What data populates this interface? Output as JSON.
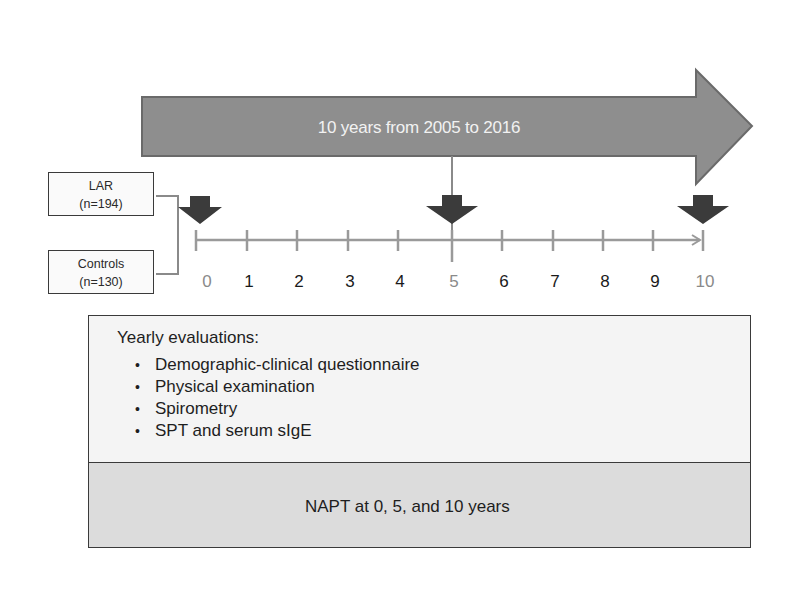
{
  "diagram": {
    "banner": {
      "text": "10 years from 2005 to 2016",
      "fill_color": "#8e8e8e",
      "text_color": "#f2f2f2"
    },
    "groups": [
      {
        "name": "LAR",
        "n_label": "(n=194)"
      },
      {
        "name": "Controls",
        "n_label": "(n=130)"
      }
    ],
    "timeline": {
      "ticks": [
        "0",
        "1",
        "2",
        "3",
        "4",
        "5",
        "6",
        "7",
        "8",
        "9",
        "10"
      ],
      "highlighted_ticks": [
        "0",
        "5",
        "10"
      ],
      "milestone_arrows_at": [
        0,
        5,
        10
      ],
      "line_color": "#9a9a9a",
      "arrow_color": "#3a3a3a"
    },
    "yearly_evaluations": {
      "title": "Yearly evaluations:",
      "items": [
        "Demographic-clinical questionnaire",
        "Physical examination",
        "Spirometry",
        "SPT and serum sIgE"
      ],
      "bullet": "•"
    },
    "napt": {
      "text": "NAPT at 0, 5, and 10 years",
      "arrow_color": "#4a4a4a"
    }
  }
}
